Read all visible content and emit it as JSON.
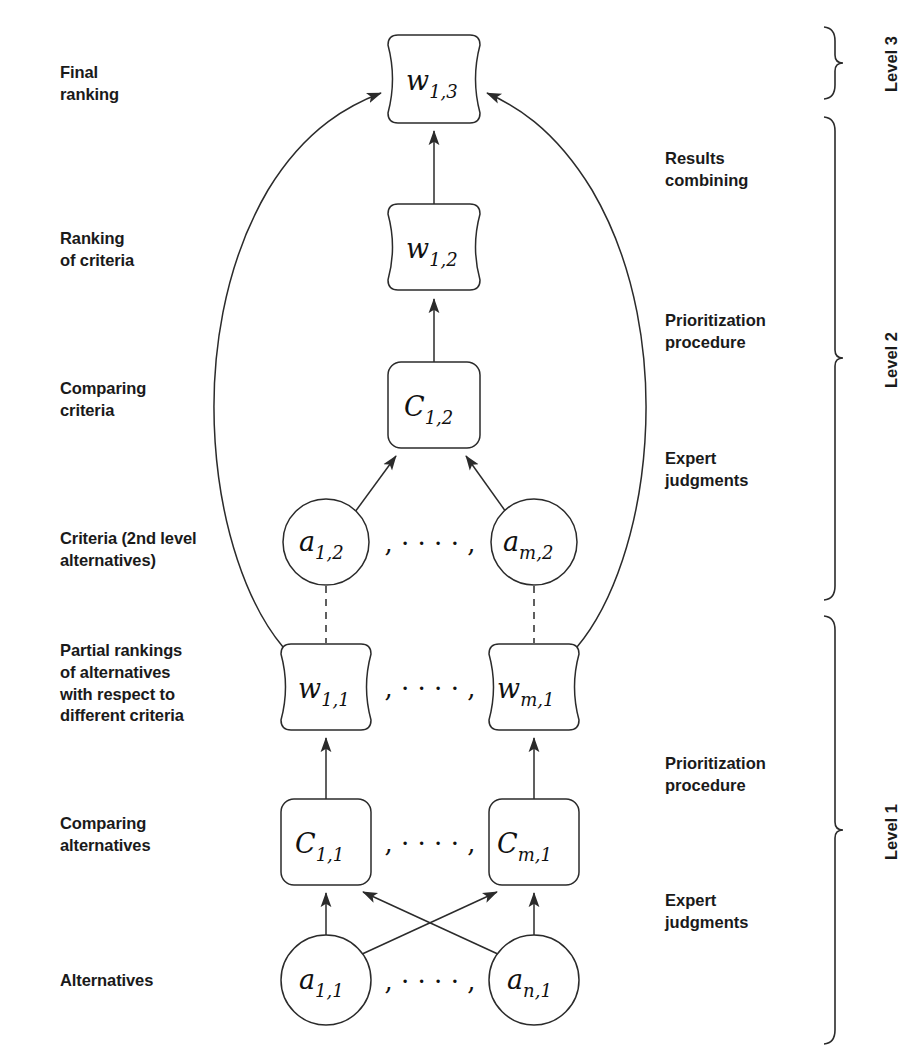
{
  "diagram": {
    "background": "#ffffff",
    "stroke": "#2b2b2b"
  },
  "left_labels": [
    {
      "id": "final-ranking",
      "lines": [
        "Final",
        "ranking"
      ],
      "x": 60,
      "y": 62
    },
    {
      "id": "ranking-of-criteria",
      "lines": [
        "Ranking",
        "of criteria"
      ],
      "x": 60,
      "y": 228
    },
    {
      "id": "comparing-criteria",
      "lines": [
        "Comparing",
        "criteria"
      ],
      "x": 60,
      "y": 378
    },
    {
      "id": "criteria-2nd-level",
      "lines": [
        "Criteria (2nd level",
        "alternatives)"
      ],
      "x": 60,
      "y": 528
    },
    {
      "id": "partial-rankings",
      "lines": [
        "Partial rankings",
        "of alternatives",
        "with respect to",
        "different criteria"
      ],
      "x": 60,
      "y": 640
    },
    {
      "id": "comparing-alternatives",
      "lines": [
        "Comparing",
        "alternatives"
      ],
      "x": 60,
      "y": 813
    },
    {
      "id": "alternatives",
      "lines": [
        "Alternatives"
      ],
      "x": 60,
      "y": 970
    }
  ],
  "right_labels": [
    {
      "id": "results-combining",
      "lines": [
        "Results",
        "combining"
      ],
      "x": 665,
      "y": 148
    },
    {
      "id": "prioritization-procedure-2",
      "lines": [
        "Prioritization",
        "procedure"
      ],
      "x": 665,
      "y": 310
    },
    {
      "id": "expert-judgments-2",
      "lines": [
        "Expert",
        "judgments"
      ],
      "x": 665,
      "y": 448
    },
    {
      "id": "prioritization-procedure-1",
      "lines": [
        "Prioritization",
        "procedure"
      ],
      "x": 665,
      "y": 753
    },
    {
      "id": "expert-judgments-1",
      "lines": [
        "Expert",
        "judgments"
      ],
      "x": 665,
      "y": 890
    }
  ],
  "levels": [
    {
      "id": "level-3",
      "label": "Level 3",
      "brace_top": 26,
      "brace_bottom": 100,
      "label_x": 905,
      "label_y": 63
    },
    {
      "id": "level-2",
      "label": "Level 2",
      "brace_top": 116,
      "brace_bottom": 600,
      "label_x": 905,
      "label_y": 358
    },
    {
      "id": "level-1",
      "label": "Level 1",
      "brace_top": 615,
      "brace_bottom": 1045,
      "label_x": 905,
      "label_y": 830
    }
  ],
  "nodes": [
    {
      "id": "w13",
      "label_main": "w",
      "label_sub": "1,3",
      "shape": "barrel",
      "cx": 434,
      "cy": 79,
      "w": 92,
      "h": 88
    },
    {
      "id": "w12",
      "label_main": "w",
      "label_sub": "1,2",
      "shape": "barrel",
      "cx": 434,
      "cy": 247,
      "w": 92,
      "h": 86
    },
    {
      "id": "c12",
      "label_main": "C",
      "label_sub": "1,2",
      "shape": "rounded-rect",
      "cx": 434,
      "cy": 405,
      "w": 92,
      "h": 86
    },
    {
      "id": "a12",
      "label_main": "a",
      "label_sub": "1,2",
      "shape": "circle",
      "cx": 326,
      "cy": 542,
      "r": 43
    },
    {
      "id": "am2",
      "label_main": "a",
      "label_sub": "m,2",
      "shape": "circle",
      "cx": 534,
      "cy": 542,
      "r": 43
    },
    {
      "id": "w11",
      "label_main": "w",
      "label_sub": "1,1",
      "shape": "barrel",
      "cx": 326,
      "cy": 687,
      "w": 90,
      "h": 86
    },
    {
      "id": "wm1",
      "label_main": "w",
      "label_sub": "m,1",
      "shape": "barrel",
      "cx": 534,
      "cy": 687,
      "w": 90,
      "h": 86
    },
    {
      "id": "c11",
      "label_main": "C",
      "label_sub": "1,1",
      "shape": "rounded-rect",
      "cx": 326,
      "cy": 842,
      "w": 90,
      "h": 86
    },
    {
      "id": "cm1",
      "label_main": "C",
      "label_sub": "m,1",
      "shape": "rounded-rect",
      "cx": 534,
      "cy": 842,
      "w": 90,
      "h": 86
    },
    {
      "id": "a11",
      "label_main": "a",
      "label_sub": "1,1",
      "shape": "circle",
      "cx": 326,
      "cy": 980,
      "r": 45
    },
    {
      "id": "an1",
      "label_main": "a",
      "label_sub": "n,1",
      "shape": "circle",
      "cx": 534,
      "cy": 980,
      "r": 45
    }
  ],
  "ellipses": [
    {
      "id": "dots-a2",
      "text": ", · · · · ,",
      "x": 430,
      "y": 552
    },
    {
      "id": "dots-w1",
      "text": ", · · · · ,",
      "x": 430,
      "y": 697
    },
    {
      "id": "dots-c1",
      "text": ", · · · · ,",
      "x": 430,
      "y": 852
    },
    {
      "id": "dots-a1",
      "text": ", · · · · ,",
      "x": 430,
      "y": 990
    }
  ],
  "edges": [
    {
      "id": "edge-w12-to-w13",
      "from": "w12",
      "to": "w13",
      "style": "solid-arrow"
    },
    {
      "id": "edge-c12-to-w12",
      "from": "c12",
      "to": "w12",
      "style": "solid-arrow"
    },
    {
      "id": "edge-a12-to-c12",
      "from": "a12",
      "to": "c12",
      "style": "solid-arrow"
    },
    {
      "id": "edge-am2-to-c12",
      "from": "am2",
      "to": "c12",
      "style": "solid-arrow"
    },
    {
      "id": "edge-a12-w11-link",
      "from": "a12",
      "to": "w11",
      "style": "dashed"
    },
    {
      "id": "edge-am2-wm1-link",
      "from": "am2",
      "to": "wm1",
      "style": "dashed"
    },
    {
      "id": "edge-w11-to-w13",
      "from": "w11",
      "to": "w13",
      "style": "curved-arrow-left"
    },
    {
      "id": "edge-wm1-to-w13",
      "from": "wm1",
      "to": "w13",
      "style": "curved-arrow-right"
    },
    {
      "id": "edge-c11-to-w11",
      "from": "c11",
      "to": "w11",
      "style": "solid-arrow"
    },
    {
      "id": "edge-cm1-to-wm1",
      "from": "cm1",
      "to": "wm1",
      "style": "solid-arrow"
    },
    {
      "id": "edge-a11-to-c11",
      "from": "a11",
      "to": "c11",
      "style": "solid-arrow"
    },
    {
      "id": "edge-an1-to-cm1",
      "from": "an1",
      "to": "cm1",
      "style": "solid-arrow"
    },
    {
      "id": "edge-a11-to-cm1",
      "from": "a11",
      "to": "cm1",
      "style": "solid-arrow-cross"
    },
    {
      "id": "edge-an1-to-c11",
      "from": "an1",
      "to": "c11",
      "style": "solid-arrow-cross"
    }
  ]
}
